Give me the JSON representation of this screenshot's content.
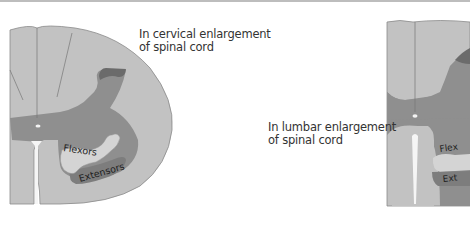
{
  "figure": {
    "panels": [
      {
        "id": "cervical",
        "caption": [
          "In cervical enlargement",
          "of spinal cord"
        ],
        "labels": {
          "flexors": "Flexors",
          "extensors": "Extensors"
        },
        "illustration": "arm-icon"
      },
      {
        "id": "lumbar",
        "caption": [
          "In lumbar enlargement",
          "of spinal cord"
        ],
        "labels": {
          "flexors": "Flex",
          "extensors": "Ext"
        },
        "illustration": "leg-icon"
      }
    ],
    "colors": {
      "white_matter": "#c2c2c2",
      "gray_matter": "#8f8f8f",
      "dark_region": "#6b6b6b",
      "light_limb": "#d4d4d4",
      "outline": "#7a7a7a",
      "text": "#333333"
    }
  }
}
